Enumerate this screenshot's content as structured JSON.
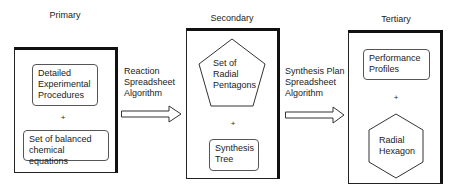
{
  "stages": [
    {
      "label": "Primary",
      "items": [
        {
          "shape": "rounded-rect",
          "lines": [
            "Detailed",
            "Experimental",
            "Procedures"
          ]
        },
        {
          "shape": "plus",
          "text": "+"
        },
        {
          "shape": "rounded-rect",
          "lines": [
            "Set of balanced",
            "chemical equations"
          ]
        }
      ]
    },
    {
      "label": "Secondary",
      "items": [
        {
          "shape": "pentagon",
          "lines": [
            "Set of",
            "Radial",
            "Pentagons"
          ]
        },
        {
          "shape": "plus",
          "text": "+"
        },
        {
          "shape": "rounded-rect",
          "lines": [
            "Synthesis",
            "Tree"
          ]
        }
      ]
    },
    {
      "label": "Tertiary",
      "items": [
        {
          "shape": "rounded-rect",
          "lines": [
            "Performance",
            "Profiles"
          ]
        },
        {
          "shape": "plus",
          "text": "+"
        },
        {
          "shape": "hexagon",
          "lines": [
            "Radial",
            "Hexagon"
          ]
        }
      ]
    }
  ],
  "arrows": [
    {
      "lines": [
        "Reaction",
        "Spreadsheet",
        "Algorithm"
      ],
      "icon": "right-arrow-icon"
    },
    {
      "lines": [
        "Synthesis Plan",
        "Spreadsheet",
        "Algorithm"
      ],
      "icon": "right-arrow-icon"
    }
  ]
}
